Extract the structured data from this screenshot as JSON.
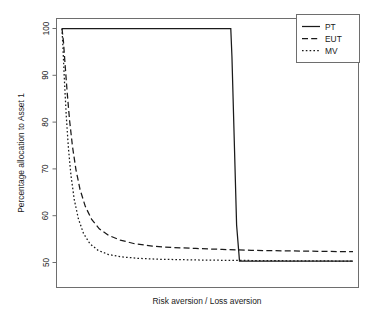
{
  "chart_data": {
    "type": "line",
    "title": "",
    "xlabel": "Risk aversion / Loss aversion",
    "ylabel": "Percentage allocation to Asset 1",
    "xlim": [
      0,
      100
    ],
    "ylim": [
      44,
      103
    ],
    "grid": false,
    "legend_position": "top-right",
    "ytick_labels": [
      "50",
      "60",
      "70",
      "80",
      "90",
      "100"
    ],
    "ytick_values": [
      50,
      60,
      70,
      80,
      90,
      100
    ],
    "xtick_labels": [],
    "series": [
      {
        "name": "PT",
        "style": "solid",
        "x": [
          0,
          0.6,
          58.0,
          58.4,
          59.2,
          60.0,
          61.0,
          100
        ],
        "values": [
          100,
          100,
          100,
          94,
          76,
          58,
          50.3,
          50.3
        ]
      },
      {
        "name": "EUT",
        "style": "dashed",
        "x": [
          0,
          0.5,
          1.1,
          1.8,
          2.6,
          3.6,
          4.8,
          6.2,
          8.0,
          10.2,
          12.8,
          16.0,
          20.0,
          25.0,
          31.0,
          38.0,
          46.0,
          55.0,
          65.0,
          76.0,
          88.0,
          100
        ],
        "values": [
          100,
          97.2,
          92.0,
          86.2,
          80.4,
          74.8,
          69.8,
          65.6,
          62.0,
          59.2,
          57.2,
          55.8,
          54.8,
          54.0,
          53.5,
          53.2,
          53.0,
          52.8,
          52.6,
          52.5,
          52.4,
          52.3
        ]
      },
      {
        "name": "MV",
        "style": "dotted",
        "x": [
          0,
          0.4,
          0.9,
          1.5,
          2.2,
          3.1,
          4.2,
          5.6,
          7.4,
          9.6,
          12.4,
          16.0,
          20.5,
          26.0,
          33.0,
          41.0,
          50.0,
          60.0,
          71.0,
          83.0,
          100
        ],
        "values": [
          100,
          95.0,
          88.0,
          81.0,
          74.5,
          68.5,
          63.5,
          59.4,
          56.2,
          54.0,
          52.6,
          51.7,
          51.2,
          50.9,
          50.7,
          50.6,
          50.5,
          50.45,
          50.4,
          50.35,
          50.3
        ]
      }
    ],
    "legend_entries": [
      {
        "label": "PT",
        "style": "solid"
      },
      {
        "label": "EUT",
        "style": "dashed"
      },
      {
        "label": "MV",
        "style": "dotted"
      }
    ],
    "colors": {
      "line": "#1a1a1a",
      "frame": "#6e6e6e",
      "background": "#ffffff"
    }
  }
}
